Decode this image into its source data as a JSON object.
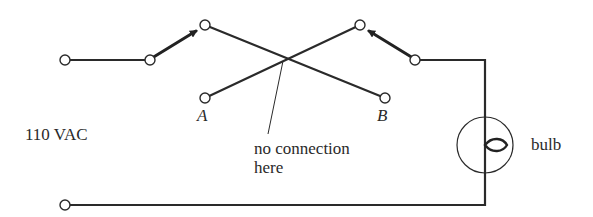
{
  "diagram": {
    "labels": {
      "source": "110 VAC",
      "terminal_a": "A",
      "terminal_b": "B",
      "note_line1": "no connection",
      "note_line2": "here",
      "bulb": "bulb"
    },
    "colors": {
      "ink": "#2a2a2a",
      "background": "#ffffff"
    },
    "components": [
      {
        "id": "source-terminal-top",
        "type": "terminal"
      },
      {
        "id": "source-terminal-bottom",
        "type": "terminal"
      },
      {
        "id": "switch-left",
        "type": "SPDT switch",
        "position": "up (to top node)"
      },
      {
        "id": "switch-right",
        "type": "SPDT switch",
        "position": "up (to top node)"
      },
      {
        "id": "cross-wires",
        "type": "crossing wires",
        "note": "no connection here"
      },
      {
        "id": "bulb",
        "type": "lamp"
      }
    ]
  }
}
